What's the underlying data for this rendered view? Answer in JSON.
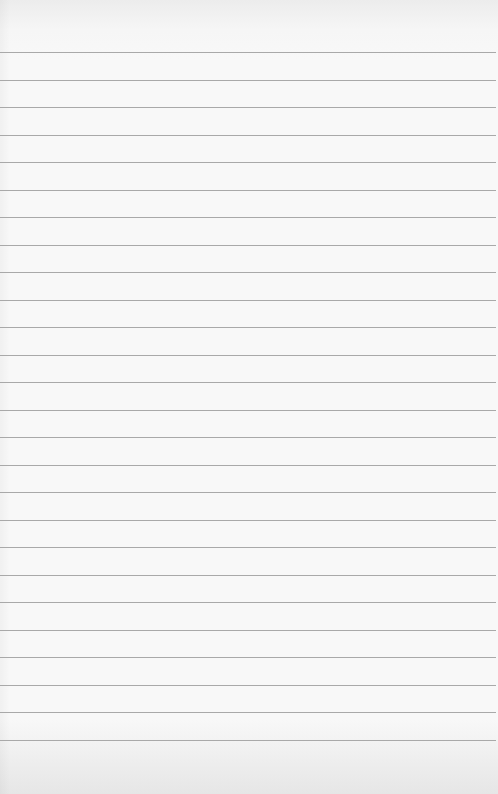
{
  "page": {
    "type": "blank lined paper",
    "background_color": "#f8f8f8",
    "line_color": "#a9a9a9",
    "line_count": 26,
    "first_line_y": 52,
    "line_spacing": 27.5
  }
}
